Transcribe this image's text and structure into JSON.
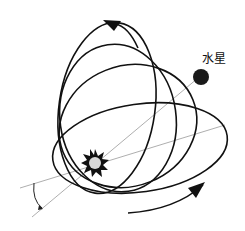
{
  "diagram": {
    "labels": {
      "planet": "水星"
    },
    "elements": {
      "sun": "sun",
      "planet": "mercury",
      "orbits": 3,
      "axis_lines": 2,
      "angle_marker": "precession-angle"
    },
    "colors": {
      "orbit": "#111111",
      "axis": "#888888",
      "planet": "#1a1a1a",
      "sun_core": "#d8d8d8",
      "sun_rays": "#111111",
      "background": "#ffffff"
    }
  }
}
